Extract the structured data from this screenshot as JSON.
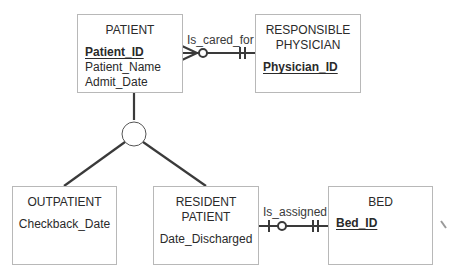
{
  "entities": {
    "patient": {
      "name": "PATIENT",
      "pk": "Patient_ID",
      "attributes": [
        "Patient_Name",
        "Admit_Date"
      ]
    },
    "physician": {
      "name_line1": "RESPONSIBLE",
      "name_line2": "PHYSICIAN",
      "pk": "Physician_ID"
    },
    "outpatient": {
      "name": "OUTPATIENT",
      "attributes": [
        "Checkback_Date"
      ]
    },
    "resident": {
      "name_line1": "RESIDENT",
      "name_line2": "PATIENT",
      "attributes": [
        "Date_Discharged"
      ]
    },
    "bed": {
      "name": "BED",
      "pk": "Bed_ID"
    }
  },
  "relationships": {
    "is_cared_for": {
      "label": "Is_cared_for",
      "left": "many-optional",
      "right": "one-mandatory"
    },
    "is_assigned": {
      "label": "Is_assigned",
      "left": "one-optional",
      "right": "one-mandatory"
    }
  },
  "subtype": {
    "symbol": "circle",
    "supertype": "PATIENT",
    "subtypes": [
      "OUTPATIENT",
      "RESIDENT PATIENT"
    ]
  },
  "colors": {
    "line": "#3a3a3a",
    "box_border": "#b8b8b8"
  }
}
